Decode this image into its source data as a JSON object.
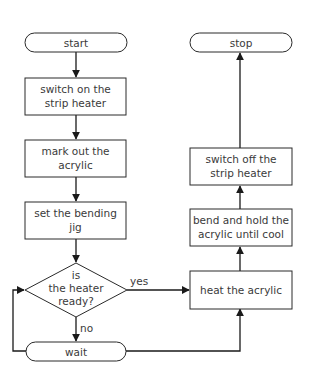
{
  "flowchart": {
    "nodes": {
      "start": {
        "type": "terminal",
        "label": "start"
      },
      "switch_on": {
        "type": "process",
        "line1": "switch on the",
        "line2": "strip heater"
      },
      "mark_out": {
        "type": "process",
        "line1": "mark out the",
        "line2": "acrylic"
      },
      "set_jig": {
        "type": "process",
        "line1": "set the bending",
        "line2": "jig"
      },
      "decision": {
        "type": "decision",
        "line1": "is",
        "line2": "the heater",
        "line3": "ready?"
      },
      "wait": {
        "type": "terminal",
        "label": "wait"
      },
      "heat": {
        "type": "process",
        "label": "heat the acrylic"
      },
      "bend": {
        "type": "process",
        "line1": "bend and hold the",
        "line2": "acrylic until cool"
      },
      "switch_off": {
        "type": "process",
        "line1": "switch off the",
        "line2": "strip heater"
      },
      "stop": {
        "type": "terminal",
        "label": "stop"
      }
    },
    "edges": {
      "yes_label": "yes",
      "no_label": "no"
    },
    "colors": {
      "stroke": "#2a2a2a",
      "text": "#3a3a3a",
      "background": "#ffffff"
    }
  }
}
